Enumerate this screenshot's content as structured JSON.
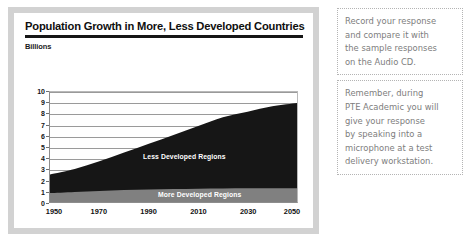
{
  "chart_card": {
    "title": "Population Growth in More, Less Developed Countries",
    "subtitle": "Billions"
  },
  "notes": [
    {
      "id": "note-audio-cd",
      "lines": [
        "Record your response",
        "and compare it with",
        "the sample responses",
        "on the Audio CD."
      ]
    },
    {
      "id": "note-pte-microphone",
      "lines": [
        "Remember, during",
        "PTE Academic you will",
        "give your response",
        "by speaking into a",
        "microphone at a test",
        "delivery workstation."
      ]
    }
  ],
  "colors": {
    "less_developed": "#161616",
    "more_developed": "#808080",
    "card_border": "#d2d2d2",
    "grid": "#9a9a9a",
    "note_text": "#7d7d7d"
  },
  "chart_data": {
    "type": "area",
    "stacked": true,
    "title": "Population Growth in More, Less Developed Countries",
    "subtitle": "Billions",
    "xlabel": "",
    "ylabel": "Billions",
    "x": [
      1950,
      1960,
      1970,
      1980,
      1990,
      2000,
      2010,
      2020,
      2030,
      2040,
      2050
    ],
    "tick_labels_x": [
      "1950",
      "1970",
      "1990",
      "2010",
      "2030",
      "2050"
    ],
    "tick_values_x": [
      1950,
      1970,
      1990,
      2010,
      2030,
      2050
    ],
    "tick_labels_y": [
      "0",
      "1",
      "2",
      "3",
      "4",
      "5",
      "6",
      "7",
      "8",
      "9",
      "10"
    ],
    "ylim": [
      0,
      10
    ],
    "xlim": [
      1950,
      2050
    ],
    "grid": true,
    "legend": "in-plot labels",
    "series": [
      {
        "name": "More Developed Regions",
        "color": "#808080",
        "values": [
          0.81,
          0.92,
          1.0,
          1.08,
          1.14,
          1.18,
          1.21,
          1.23,
          1.25,
          1.26,
          1.26
        ]
      },
      {
        "name": "Less Developed Regions",
        "color": "#161616",
        "values": [
          1.69,
          2.08,
          2.7,
          3.42,
          4.16,
          4.92,
          5.69,
          6.47,
          6.95,
          7.44,
          7.74
        ]
      }
    ],
    "totals": [
      2.5,
      3.0,
      3.7,
      4.5,
      5.3,
      6.1,
      6.9,
      7.7,
      8.2,
      8.7,
      9.0
    ]
  }
}
